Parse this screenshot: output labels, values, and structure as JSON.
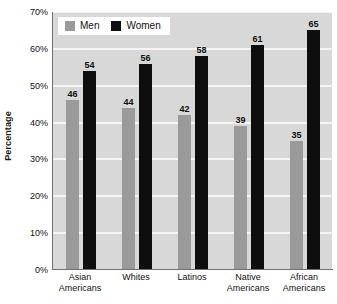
{
  "chart_data": {
    "type": "bar",
    "title": "",
    "xlabel": "",
    "ylabel": "Percentage",
    "ylim": [
      0,
      70
    ],
    "grid": true,
    "legend_position": "top-left",
    "categories": [
      "Asian Americans",
      "Whites",
      "Latinos",
      "Native Americans",
      "African Americans"
    ],
    "category_lines": [
      [
        "Asian",
        "Americans"
      ],
      [
        "Whites",
        ""
      ],
      [
        "Latinos",
        ""
      ],
      [
        "Native",
        "Americans"
      ],
      [
        "African",
        "Americans"
      ]
    ],
    "series": [
      {
        "name": "Men",
        "values": [
          46,
          44,
          42,
          39,
          35
        ],
        "color": "#9a9a9a"
      },
      {
        "name": "Women",
        "values": [
          54,
          56,
          58,
          61,
          65
        ],
        "color": "#0e0e0e"
      }
    ],
    "y_ticks": [
      0,
      10,
      20,
      30,
      40,
      50,
      60,
      70
    ],
    "y_tick_labels": [
      "0%",
      "10%",
      "20%",
      "30%",
      "40%",
      "50%",
      "60%",
      "70%"
    ]
  },
  "legend": {
    "men_label": "Men",
    "women_label": "Women"
  },
  "axes": {
    "y_title": "Percentage"
  },
  "colors": {
    "men": "#9a9a9a",
    "women": "#0e0e0e",
    "plot_background": "#d8d8d8",
    "gridline": "#f4f4f4",
    "axis": "#6f6f6f",
    "text": "#111111"
  }
}
